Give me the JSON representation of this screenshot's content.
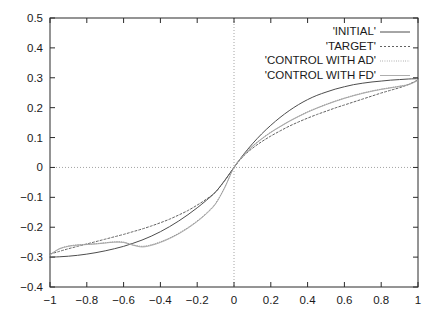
{
  "chart_data": {
    "type": "line",
    "title": "",
    "subtitle": "",
    "xlabel": "",
    "ylabel": "",
    "xlim": [
      -1,
      1
    ],
    "ylim": [
      -0.4,
      0.5
    ],
    "grid": "zero-axis-only",
    "legend_position": "top-right",
    "xticks": [
      -1,
      -0.8,
      -0.6,
      -0.4,
      -0.2,
      0,
      0.2,
      0.4,
      0.6,
      0.8,
      1
    ],
    "xtick_labels": [
      "-1",
      "-0.8",
      "-0.6",
      "-0.4",
      "-0.2",
      "0",
      "0.2",
      "0.4",
      "0.6",
      "0.8",
      "1"
    ],
    "yticks": [
      -0.4,
      -0.3,
      -0.2,
      -0.1,
      0,
      0.1,
      0.2,
      0.3,
      0.4,
      0.5
    ],
    "ytick_labels": [
      "-0.4",
      "-0.3",
      "-0.2",
      "-0.1",
      "0",
      "0.1",
      "0.2",
      "0.3",
      "0.4",
      "0.5"
    ],
    "x": [
      -1,
      -0.95,
      -0.9,
      -0.85,
      -0.8,
      -0.75,
      -0.7,
      -0.65,
      -0.6,
      -0.55,
      -0.5,
      -0.45,
      -0.4,
      -0.35,
      -0.3,
      -0.25,
      -0.2,
      -0.15,
      -0.1,
      -0.05,
      0,
      0.05,
      0.1,
      0.15,
      0.2,
      0.25,
      0.3,
      0.35,
      0.4,
      0.45,
      0.5,
      0.55,
      0.6,
      0.65,
      0.7,
      0.75,
      0.8,
      0.85,
      0.9,
      0.95,
      1
    ],
    "series": [
      {
        "name": "'INITIAL'",
        "style": "solid",
        "color": "#4d4d4d",
        "values": [
          -0.3,
          -0.299,
          -0.297,
          -0.294,
          -0.29,
          -0.285,
          -0.279,
          -0.272,
          -0.264,
          -0.254,
          -0.243,
          -0.23,
          -0.215,
          -0.198,
          -0.179,
          -0.158,
          -0.135,
          -0.11,
          -0.082,
          -0.043,
          0.0,
          0.042,
          0.079,
          0.112,
          0.141,
          0.167,
          0.19,
          0.21,
          0.227,
          0.241,
          0.252,
          0.262,
          0.27,
          0.277,
          0.282,
          0.286,
          0.289,
          0.292,
          0.294,
          0.296,
          0.297
        ]
      },
      {
        "name": "'TARGET'",
        "style": "dotted",
        "color": "#5a5a5a",
        "values": [
          -0.29,
          -0.281,
          -0.272,
          -0.264,
          -0.256,
          -0.248,
          -0.24,
          -0.232,
          -0.224,
          -0.215,
          -0.206,
          -0.196,
          -0.185,
          -0.173,
          -0.159,
          -0.144,
          -0.126,
          -0.106,
          -0.082,
          -0.044,
          0.0,
          0.037,
          0.064,
          0.086,
          0.105,
          0.122,
          0.138,
          0.152,
          0.165,
          0.177,
          0.188,
          0.199,
          0.209,
          0.219,
          0.229,
          0.239,
          0.249,
          0.258,
          0.267,
          0.278,
          0.293
        ]
      },
      {
        "name": "'CONTROL WITH AD'",
        "style": "fine-dotted",
        "color": "#8a8a8a",
        "values": [
          -0.292,
          -0.272,
          -0.263,
          -0.259,
          -0.257,
          -0.255,
          -0.252,
          -0.249,
          -0.25,
          -0.259,
          -0.264,
          -0.259,
          -0.249,
          -0.236,
          -0.22,
          -0.201,
          -0.179,
          -0.153,
          -0.12,
          -0.066,
          0.0,
          0.04,
          0.071,
          0.096,
          0.118,
          0.137,
          0.155,
          0.171,
          0.186,
          0.199,
          0.211,
          0.222,
          0.232,
          0.241,
          0.249,
          0.256,
          0.262,
          0.267,
          0.272,
          0.278,
          0.292
        ]
      },
      {
        "name": "'CONTROL WITH FD'",
        "style": "solid-light",
        "color": "#a5a5a5",
        "values": [
          -0.292,
          -0.273,
          -0.264,
          -0.26,
          -0.258,
          -0.256,
          -0.253,
          -0.25,
          -0.251,
          -0.26,
          -0.266,
          -0.261,
          -0.251,
          -0.238,
          -0.222,
          -0.203,
          -0.181,
          -0.155,
          -0.122,
          -0.067,
          0.0,
          0.039,
          0.07,
          0.095,
          0.117,
          0.136,
          0.154,
          0.17,
          0.185,
          0.198,
          0.21,
          0.221,
          0.231,
          0.24,
          0.248,
          0.255,
          0.261,
          0.266,
          0.271,
          0.277,
          0.291
        ]
      }
    ]
  },
  "legend": {
    "entries": [
      {
        "label": "'INITIAL'",
        "style": "solid"
      },
      {
        "label": "'TARGET'",
        "style": "dotted"
      },
      {
        "label": "'CONTROL WITH AD'",
        "style": "fine-dotted"
      },
      {
        "label": "'CONTROL WITH FD'",
        "style": "solid-light"
      }
    ]
  },
  "colors": {
    "axis": "#2b2b2b",
    "grid": "#9a9a9a",
    "background": "#ffffff",
    "text": "#1a1a1a"
  }
}
